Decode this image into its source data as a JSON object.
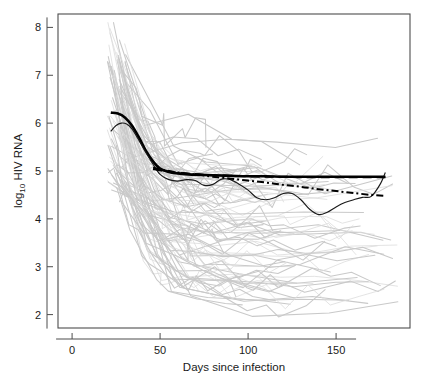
{
  "figure": {
    "background": "#ffffff",
    "frame_color": "#4d4d4d",
    "width": 422,
    "height": 385
  },
  "chart_data": {
    "type": "line",
    "title": "",
    "xlabel": "Days since infection",
    "ylabel": "log10 HIV RNA",
    "ylabel_display": "log",
    "ylabel_sub": "10",
    "ylabel_rest": " HIV RNA",
    "xlim": [
      -8,
      192
    ],
    "ylim": [
      1.72,
      8.28
    ],
    "xticks": [
      0,
      50,
      100,
      150
    ],
    "xtick_labels": [
      "0",
      "50",
      "100",
      "150"
    ],
    "yticks": [
      2,
      3,
      4,
      5,
      6,
      7,
      8
    ],
    "ytick_labels": [
      "2",
      "3",
      "4",
      "5",
      "6",
      "7",
      "8"
    ],
    "grid": false,
    "legend": "none",
    "spaghetti_color": "#c9c9c9",
    "spaghetti_color_light": "#dcdcdc",
    "spaghetti_width": 0.8,
    "n_subjects": 100,
    "series": [
      {
        "name": "population mean smooth (thick solid)",
        "style": "solid",
        "color": "#000000",
        "width": 2.6,
        "x": [
          22,
          26,
          30,
          34,
          38,
          42,
          46,
          50,
          55,
          60,
          66,
          72,
          80,
          90,
          100,
          110,
          120,
          130,
          140,
          150,
          160,
          170,
          178
        ],
        "y": [
          6.22,
          6.2,
          6.12,
          5.95,
          5.7,
          5.42,
          5.2,
          5.05,
          4.98,
          4.95,
          4.93,
          4.92,
          4.91,
          4.9,
          4.89,
          4.89,
          4.88,
          4.88,
          4.88,
          4.88,
          4.88,
          4.88,
          4.88
        ]
      },
      {
        "name": "individual-level smooth (thin solid wiggly)",
        "style": "solid",
        "color": "#1a1a1a",
        "width": 1.15,
        "x": [
          22,
          25,
          28,
          31,
          34,
          38,
          42,
          46,
          50,
          55,
          60,
          65,
          70,
          75,
          80,
          85,
          90,
          95,
          100,
          105,
          110,
          115,
          120,
          125,
          130,
          135,
          140,
          145,
          150,
          155,
          160,
          165,
          170,
          175,
          178
        ],
        "y": [
          5.83,
          5.95,
          6.0,
          5.98,
          5.88,
          5.64,
          5.38,
          5.14,
          4.93,
          4.82,
          4.79,
          4.82,
          4.8,
          4.7,
          4.72,
          4.83,
          4.82,
          4.72,
          4.6,
          4.44,
          4.4,
          4.44,
          4.53,
          4.53,
          4.4,
          4.2,
          4.09,
          4.14,
          4.25,
          4.34,
          4.4,
          4.45,
          4.47,
          4.72,
          4.97
        ]
      },
      {
        "name": "upper quantile fit (long dash)",
        "style": "dashed",
        "dash": "9,5",
        "color": "#000000",
        "width": 2.1,
        "x": [
          46,
          52,
          58,
          64,
          72,
          80,
          90,
          100,
          110,
          120,
          130,
          140,
          150,
          160,
          170,
          178
        ],
        "y": [
          5.04,
          5.0,
          4.97,
          4.95,
          4.93,
          4.91,
          4.9,
          4.89,
          4.88,
          4.88,
          4.87,
          4.87,
          4.87,
          4.87,
          4.87,
          4.87
        ]
      },
      {
        "name": "lower quantile fit (short dash / dash-dot)",
        "style": "dash-dot",
        "dash": "7,3,2,3",
        "color": "#000000",
        "width": 2.0,
        "x": [
          46,
          52,
          58,
          64,
          72,
          80,
          90,
          100,
          110,
          120,
          130,
          140,
          150,
          160,
          170,
          178
        ],
        "y": [
          5.07,
          5.02,
          4.98,
          4.95,
          4.92,
          4.88,
          4.84,
          4.8,
          4.76,
          4.71,
          4.67,
          4.62,
          4.58,
          4.54,
          4.5,
          4.48
        ]
      }
    ],
    "spaghetti_note": "~100 individual subject log10 HIV RNA trajectories, first observation between day 20 and day 30, peaks up to 7.8, settling between 2.1 and 5.8"
  }
}
